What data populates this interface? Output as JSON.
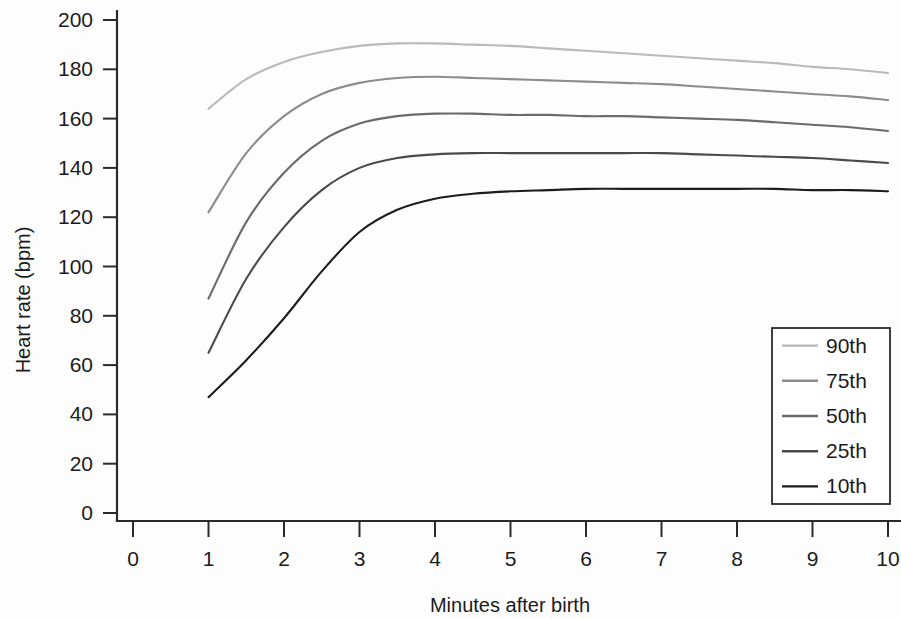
{
  "chart_data": {
    "type": "line",
    "title": "",
    "xlabel": "Minutes after birth",
    "ylabel": "Heart rate (bpm)",
    "xlim": [
      0,
      10
    ],
    "ylim": [
      0,
      200
    ],
    "xticks": [
      0,
      1,
      2,
      3,
      4,
      5,
      6,
      7,
      8,
      9,
      10
    ],
    "yticks": [
      0,
      20,
      40,
      60,
      80,
      100,
      120,
      140,
      160,
      180,
      200
    ],
    "xtick_labels": [
      "0",
      "1",
      "2",
      "3",
      "4",
      "5",
      "6",
      "7",
      "8",
      "9",
      "10"
    ],
    "ytick_labels": [
      "0",
      "20",
      "40",
      "60",
      "80",
      "100",
      "120",
      "140",
      "160",
      "180",
      "200"
    ],
    "grid": false,
    "legend_position": "lower right",
    "x": [
      1,
      1.5,
      2,
      2.5,
      3,
      3.5,
      4,
      4.5,
      5,
      5.5,
      6,
      6.5,
      7,
      7.5,
      8,
      8.5,
      9,
      9.5,
      10
    ],
    "series": [
      {
        "name": "90th",
        "color": "#b9b9b9",
        "values": [
          164,
          176,
          183,
          187,
          189.5,
          190.5,
          190.5,
          190,
          189.5,
          188.5,
          187.5,
          186.5,
          185.5,
          184.5,
          183.5,
          182.5,
          181,
          180,
          178.5
        ]
      },
      {
        "name": "75th",
        "color": "#8c8c8c",
        "values": [
          122,
          146,
          161,
          170,
          174.5,
          176.5,
          177,
          176.5,
          176,
          175.5,
          175,
          174.5,
          174,
          173,
          172,
          171,
          170,
          169,
          167.5
        ]
      },
      {
        "name": "50th",
        "color": "#6a6a6a",
        "values": [
          87,
          118,
          138,
          151,
          158,
          161,
          162,
          162,
          161.5,
          161.5,
          161,
          161,
          160.5,
          160,
          159.5,
          158.5,
          157.5,
          156.5,
          155
        ]
      },
      {
        "name": "25th",
        "color": "#4a4a4a",
        "values": [
          65,
          95,
          116,
          131,
          140,
          144,
          145.5,
          146,
          146,
          146,
          146,
          146,
          146,
          145.5,
          145,
          144.5,
          144,
          143,
          142
        ]
      },
      {
        "name": "10th",
        "color": "#1c1c1c",
        "values": [
          47,
          62,
          79,
          98,
          114,
          123,
          127.5,
          129.5,
          130.5,
          131,
          131.5,
          131.5,
          131.5,
          131.5,
          131.5,
          131.5,
          131,
          131,
          130.5
        ]
      }
    ],
    "legend_entries": [
      {
        "label": "90th",
        "color": "#b9b9b9"
      },
      {
        "label": "75th",
        "color": "#8c8c8c"
      },
      {
        "label": "50th",
        "color": "#6a6a6a"
      },
      {
        "label": "25th",
        "color": "#4a4a4a"
      },
      {
        "label": "10th",
        "color": "#1c1c1c"
      }
    ]
  }
}
